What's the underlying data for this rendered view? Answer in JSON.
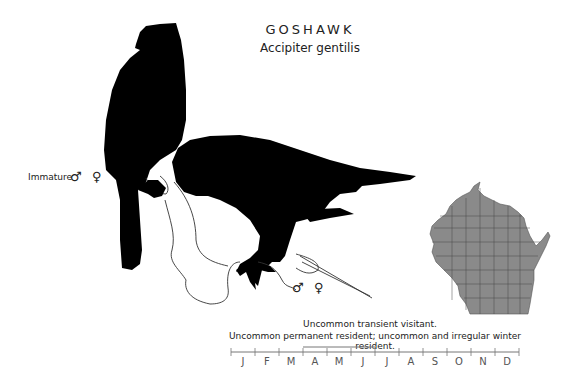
{
  "header": {
    "common_name": "GOSHAWK",
    "scientific_name": "Accipiter gentilis"
  },
  "illustration": {
    "immature_label": "Immature",
    "immature_symbols": {
      "male": "♂",
      "female": "♀"
    },
    "adult_symbols": {
      "male": "♂",
      "female": "♀"
    },
    "silhouette_color": "#000000",
    "outline_color": "#333333"
  },
  "range_map": {
    "region": "Wisconsin",
    "fill_color": "#8a8a8a",
    "border_color": "#3a3a3a"
  },
  "status": {
    "line1": "Uncommon transient visitant.",
    "line2": "Uncommon permanent resident; uncommon and irregular winter resident."
  },
  "calendar": {
    "months": [
      "J",
      "F",
      "M",
      "A",
      "M",
      "J",
      "J",
      "A",
      "S",
      "O",
      "N",
      "D"
    ],
    "axis_color": "#777777",
    "bars": [
      {
        "label": "presence",
        "start_month": 1,
        "end_month": 12
      },
      {
        "label": "breeding",
        "start_month": 4.0,
        "end_month": 7.0
      }
    ]
  }
}
